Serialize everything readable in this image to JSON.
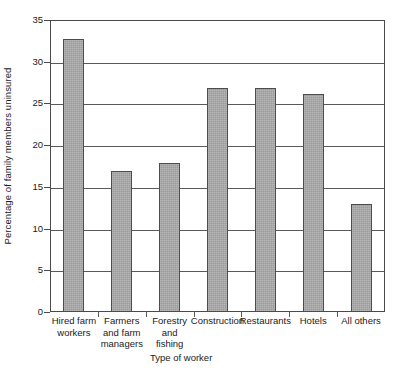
{
  "chart_data": {
    "type": "bar",
    "title": "",
    "subtitle": "",
    "xlabel": "Type of worker",
    "ylabel": "Percentage of family members uninsured",
    "categories": [
      "Hired farm workers",
      "Farmers and farm managers",
      "Forestry and fishing",
      "Construction",
      "Restaurants",
      "Hotels",
      "All others"
    ],
    "category_label_lines": [
      [
        "Hired farm",
        "workers"
      ],
      [
        "Farmers",
        "and farm",
        "managers"
      ],
      [
        "Forestry",
        "and",
        "fishing"
      ],
      [
        "Construction"
      ],
      [
        "Restaurants"
      ],
      [
        "Hotels"
      ],
      [
        "All others"
      ]
    ],
    "values": [
      32.7,
      16.9,
      17.9,
      26.9,
      26.9,
      26.1,
      12.9
    ],
    "ylim": [
      0,
      35
    ],
    "yticks": [
      0,
      5,
      10,
      15,
      20,
      25,
      30,
      35
    ],
    "ytick_labels": [
      "0",
      "5",
      "10",
      "15",
      "20",
      "25",
      "30",
      "35"
    ],
    "grid": "horizontal",
    "legend": "none",
    "bar_fill_color": "#9a9a9a",
    "bar_border_color": "#4d4d4d",
    "axis_color": "#4a4a4a",
    "background_color": "#ffffff"
  }
}
